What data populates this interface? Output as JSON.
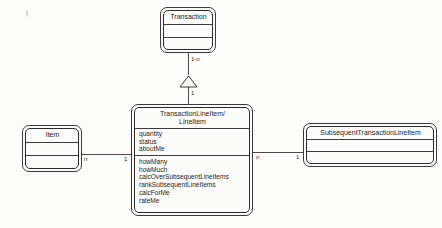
{
  "diagram": {
    "type": "uml-class-diagram",
    "classes": [
      {
        "id": "transaction",
        "name": "Transaction",
        "attributes": [],
        "operations": []
      },
      {
        "id": "transaction-line-item",
        "name_line1": "TransactionLineItem/",
        "name_line2": "LineItem",
        "attributes": [
          "quantity",
          "status",
          "aboutMe"
        ],
        "operations": [
          "howMany",
          "howMuch",
          "calcOverSubsequentLineItems",
          "rankSubsequentLineItems",
          "calcForMe",
          "rateMe"
        ]
      },
      {
        "id": "item",
        "name": "Item",
        "attributes": [],
        "operations": []
      },
      {
        "id": "subsequent-transaction-line-item",
        "name": "SubsequentTransactionLineItem",
        "attributes": [],
        "operations": []
      }
    ],
    "relationships": [
      {
        "id": "transaction-to-lineitem",
        "kind": "generalization",
        "from": "transaction-line-item",
        "to": "transaction",
        "source_multiplicity": "1",
        "target_multiplicity": "1-n"
      },
      {
        "id": "item-to-lineitem",
        "kind": "association",
        "from": "item",
        "to": "transaction-line-item",
        "source_multiplicity": "n",
        "target_multiplicity": "1"
      },
      {
        "id": "lineitem-to-subsequent",
        "kind": "association",
        "from": "transaction-line-item",
        "to": "subsequent-transaction-line-item",
        "source_multiplicity": "n",
        "target_multiplicity": "1"
      }
    ]
  },
  "colors": {
    "ink": "#1d1d1d",
    "line": "#4a4a4a",
    "box_fill": "#fcfcfa",
    "page": "#fdfdfb"
  }
}
